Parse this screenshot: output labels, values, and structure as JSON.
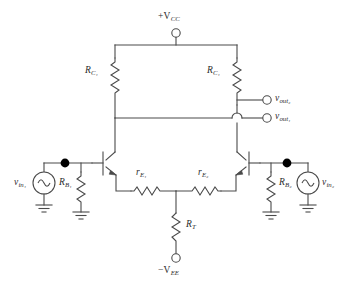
{
  "diagram": {
    "type": "schematic",
    "background_color": "#ffffff",
    "line_color": "#4a4a4a"
  },
  "supplies": {
    "positive": {
      "sign": "+",
      "symbol": "V",
      "subscript": "CC",
      "terminal": "open-circle"
    },
    "negative": {
      "sign": "−",
      "symbol": "V",
      "subscript": "EE",
      "terminal": "open-circle"
    }
  },
  "components": {
    "collector_resistor_left": {
      "symbol": "R",
      "subscript": "C₁",
      "kind": "resistor"
    },
    "collector_resistor_right": {
      "symbol": "R",
      "subscript": "C₁",
      "kind": "resistor"
    },
    "emitter_resistor_left": {
      "symbol": "r",
      "subscript": "E₁",
      "kind": "resistor"
    },
    "emitter_resistor_right": {
      "symbol": "r",
      "subscript": "E₂",
      "kind": "resistor"
    },
    "tail_resistor": {
      "symbol": "R",
      "subscript": "T",
      "kind": "resistor"
    },
    "base_resistor_left": {
      "symbol": "R",
      "subscript": "B₁",
      "kind": "resistor"
    },
    "base_resistor_right": {
      "symbol": "R",
      "subscript": "B₂",
      "kind": "resistor"
    },
    "transistor_left": {
      "kind": "npn-bjt"
    },
    "transistor_right": {
      "kind": "npn-bjt"
    }
  },
  "sources": {
    "input_left": {
      "symbol": "v",
      "subscript": "in₁",
      "kind": "ac-source"
    },
    "input_right": {
      "symbol": "v",
      "subscript": "in₂",
      "kind": "ac-source"
    }
  },
  "outputs": {
    "out_upper": {
      "symbol": "v",
      "subscript": "out₂",
      "terminal": "open-circle"
    },
    "out_lower": {
      "symbol": "v",
      "subscript": "out₁",
      "terminal": "open-circle"
    }
  },
  "grounds": {
    "count": 4,
    "kind": "earth-ground"
  },
  "labels": {
    "vcc": "+V",
    "vcc_sub": "CC",
    "vee": "−V",
    "vee_sub": "EE",
    "rc1_left": "R",
    "rc1_left_sub": "C₁",
    "rc1_right": "R",
    "rc1_right_sub": "C₁",
    "re1": "r",
    "re1_sub": "E₁",
    "re2": "r",
    "re2_sub": "E₂",
    "rt": "R",
    "rt_sub": "T",
    "rb1": "R",
    "rb1_sub": "B₁",
    "rb2": "R",
    "rb2_sub": "B₂",
    "vin1": "v",
    "vin1_sub": "in₁",
    "vin2": "v",
    "vin2_sub": "in₂",
    "vout1": "v",
    "vout1_sub": "out₁",
    "vout2": "v",
    "vout2_sub": "out₂"
  }
}
